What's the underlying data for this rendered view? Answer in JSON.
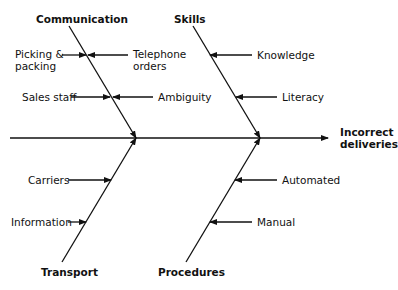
{
  "effect": {
    "line1": "Incorrect",
    "line2": "deliveries"
  },
  "categories": {
    "communication": "Communication",
    "skills": "Skills",
    "transport": "Transport",
    "procedures": "Procedures"
  },
  "causes": {
    "picking_line1": "Picking &",
    "picking_line2": "packing",
    "telephone_line1": "Telephone",
    "telephone_line2": "orders",
    "sales_staff": "Sales staff",
    "ambiguity": "Ambiguity",
    "knowledge": "Knowledge",
    "literacy": "Literacy",
    "carriers": "Carriers",
    "information": "Information",
    "automated": "Automated",
    "manual": "Manual"
  }
}
